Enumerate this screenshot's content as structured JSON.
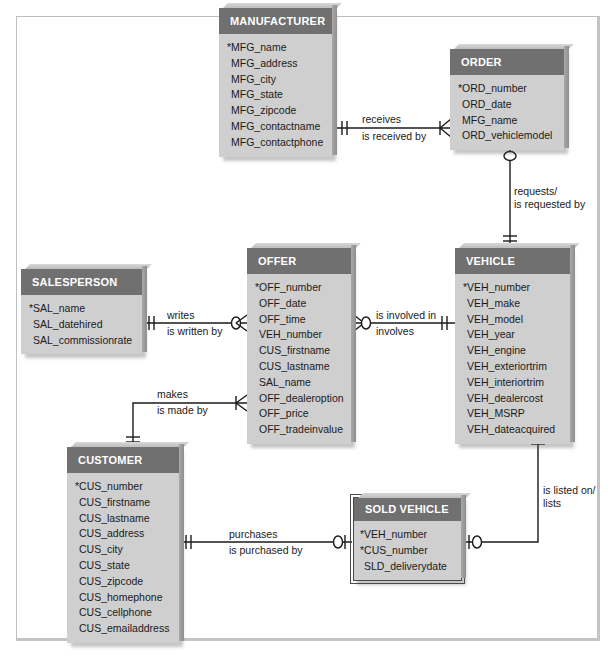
{
  "diagram": {
    "type": "crows-foot-erd",
    "entities": {
      "manufacturer": {
        "name": "MANUFACTURER",
        "attributes": [
          {
            "name": "*MFG_name",
            "pk": true
          },
          {
            "name": "MFG_address",
            "pk": false
          },
          {
            "name": "MFG_city",
            "pk": false
          },
          {
            "name": "MFG_state",
            "pk": false
          },
          {
            "name": "MFG_zipcode",
            "pk": false
          },
          {
            "name": "MFG_contactname",
            "pk": false
          },
          {
            "name": "MFG_contactphone",
            "pk": false
          }
        ]
      },
      "order": {
        "name": "ORDER",
        "attributes": [
          {
            "name": "*ORD_number",
            "pk": true
          },
          {
            "name": "ORD_date",
            "pk": false
          },
          {
            "name": "MFG_name",
            "pk": false
          },
          {
            "name": "ORD_vehiclemodel",
            "pk": false
          }
        ]
      },
      "salesperson": {
        "name": "SALESPERSON",
        "attributes": [
          {
            "name": "*SAL_name",
            "pk": true
          },
          {
            "name": "SAL_datehired",
            "pk": false
          },
          {
            "name": "SAL_commissionrate",
            "pk": false
          }
        ]
      },
      "offer": {
        "name": "OFFER",
        "attributes": [
          {
            "name": "*OFF_number",
            "pk": true
          },
          {
            "name": "OFF_date",
            "pk": false
          },
          {
            "name": "OFF_time",
            "pk": false
          },
          {
            "name": "VEH_number",
            "pk": false
          },
          {
            "name": "CUS_firstname",
            "pk": false
          },
          {
            "name": "CUS_lastname",
            "pk": false
          },
          {
            "name": "SAL_name",
            "pk": false
          },
          {
            "name": "OFF_dealeroption",
            "pk": false
          },
          {
            "name": "OFF_price",
            "pk": false
          },
          {
            "name": "OFF_tradeinvalue",
            "pk": false
          }
        ]
      },
      "vehicle": {
        "name": "VEHICLE",
        "attributes": [
          {
            "name": "*VEH_number",
            "pk": true
          },
          {
            "name": "VEH_make",
            "pk": false
          },
          {
            "name": "VEH_model",
            "pk": false
          },
          {
            "name": "VEH_year",
            "pk": false
          },
          {
            "name": "VEH_engine",
            "pk": false
          },
          {
            "name": "VEH_exteriortrim",
            "pk": false
          },
          {
            "name": "VEH_interiortrim",
            "pk": false
          },
          {
            "name": "VEH_dealercost",
            "pk": false
          },
          {
            "name": "VEH_MSRP",
            "pk": false
          },
          {
            "name": "VEH_dateacquired",
            "pk": false
          }
        ]
      },
      "customer": {
        "name": "CUSTOMER",
        "attributes": [
          {
            "name": "*CUS_number",
            "pk": true
          },
          {
            "name": "CUS_firstname",
            "pk": false
          },
          {
            "name": "CUS_lastname",
            "pk": false
          },
          {
            "name": "CUS_address",
            "pk": false
          },
          {
            "name": "CUS_city",
            "pk": false
          },
          {
            "name": "CUS_state",
            "pk": false
          },
          {
            "name": "CUS_zipcode",
            "pk": false
          },
          {
            "name": "CUS_homephone",
            "pk": false
          },
          {
            "name": "CUS_cellphone",
            "pk": false
          },
          {
            "name": "CUS_emailaddress",
            "pk": false
          }
        ]
      },
      "sold_vehicle": {
        "name": "SOLD VEHICLE",
        "weak": true,
        "attributes": [
          {
            "name": "*VEH_number",
            "pk": true
          },
          {
            "name": "*CUS_number",
            "pk": true
          },
          {
            "name": "SLD_deliverydate",
            "pk": false
          }
        ]
      }
    },
    "relationships": {
      "receives": {
        "from": "MANUFACTURER",
        "to": "ORDER",
        "label_top": "receives",
        "label_bottom": "is received by",
        "from_cardinality": "one-and-only-one",
        "to_cardinality": "one-or-many"
      },
      "requests": {
        "from": "ORDER",
        "to": "VEHICLE",
        "label_top": "requests/",
        "label_bottom": "is requested by",
        "from_cardinality": "zero-or-one",
        "to_cardinality": "one-and-only-one"
      },
      "writes": {
        "from": "SALESPERSON",
        "to": "OFFER",
        "label_top": "writes",
        "label_bottom": "is written by",
        "from_cardinality": "one-and-only-one",
        "to_cardinality": "zero-or-many"
      },
      "involved": {
        "from": "OFFER",
        "to": "VEHICLE",
        "label_top": "is involved in",
        "label_bottom": "involves",
        "from_cardinality": "zero-or-many",
        "to_cardinality": "one-and-only-one"
      },
      "makes": {
        "from": "CUSTOMER",
        "to": "OFFER",
        "label_top": "makes",
        "label_bottom": "is made by",
        "from_cardinality": "one-and-only-one",
        "to_cardinality": "one-or-many"
      },
      "purchases": {
        "from": "CUSTOMER",
        "to": "SOLD VEHICLE",
        "label_top": "purchases",
        "label_bottom": "is purchased by",
        "from_cardinality": "one-and-only-one",
        "to_cardinality": "zero-or-one"
      },
      "listed": {
        "from": "VEHICLE",
        "to": "SOLD VEHICLE",
        "label_top": "is listed on/",
        "label_bottom": "lists",
        "from_cardinality": "one-and-only-one",
        "to_cardinality": "zero-or-one"
      }
    }
  }
}
